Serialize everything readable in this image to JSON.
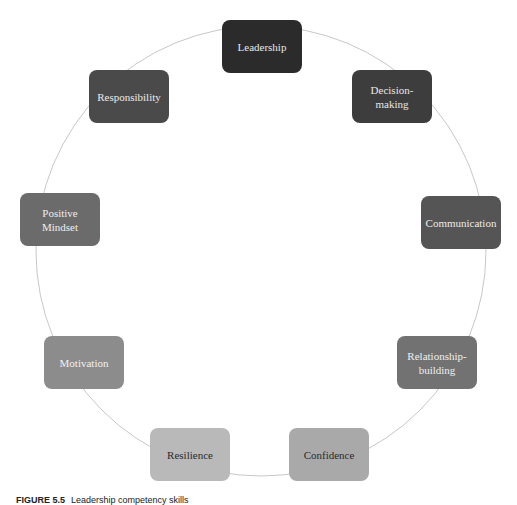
{
  "diagram": {
    "type": "cycle",
    "center": [
      261,
      251
    ],
    "radius": 225,
    "ring_color": "#c8c8c8",
    "nodes": [
      {
        "label": "Leadership",
        "x": 222,
        "y": 20,
        "bg": "#2b2b2b",
        "fg": "#e8e8e8"
      },
      {
        "label": "Decision-\nmaking",
        "line1": "Decision-",
        "line2": "making",
        "x": 352,
        "y": 70,
        "bg": "#3d3d3d",
        "fg": "#e8e8e8"
      },
      {
        "label": "Communication",
        "x": 421,
        "y": 196,
        "bg": "#555555",
        "fg": "#ececec"
      },
      {
        "label": "Relationship-\nbuilding",
        "line1": "Relationship-",
        "line2": "building",
        "x": 397,
        "y": 336,
        "bg": "#727272",
        "fg": "#f0f0f0"
      },
      {
        "label": "Confidence",
        "x": 289,
        "y": 428,
        "bg": "#a9a9a9",
        "fg": "#2a2a2a"
      },
      {
        "label": "Resilience",
        "x": 150,
        "y": 428,
        "bg": "#b9b9b9",
        "fg": "#2a2a2a"
      },
      {
        "label": "Motivation",
        "x": 44,
        "y": 336,
        "bg": "#8c8c8c",
        "fg": "#f2f2f2"
      },
      {
        "label": "Positive\nMindset",
        "line1": "Positive",
        "line2": "Mindset",
        "x": 20,
        "y": 193,
        "bg": "#6b6b6b",
        "fg": "#eeeeee"
      },
      {
        "label": "Responsibility",
        "x": 89,
        "y": 70,
        "bg": "#4a4a4a",
        "fg": "#eaeaea"
      }
    ]
  },
  "caption": {
    "figure": "FIGURE 5.5",
    "text": "Leadership competency skills"
  }
}
